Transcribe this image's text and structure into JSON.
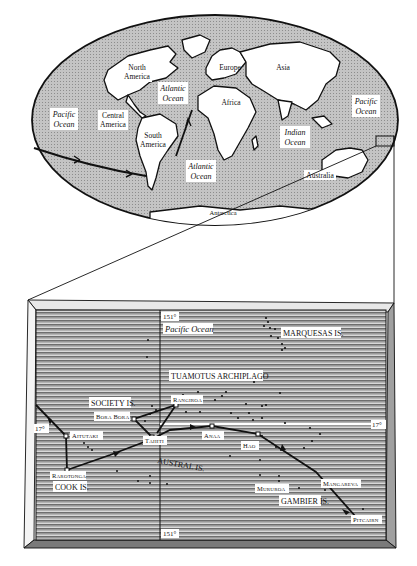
{
  "world_map": {
    "continents": [
      {
        "label_line1": "North",
        "label_line2": "America"
      },
      {
        "label_line1": "Central",
        "label_line2": "America"
      },
      {
        "label_line1": "South",
        "label_line2": "America"
      },
      {
        "label_line1": "Europe"
      },
      {
        "label_line1": "Asia"
      },
      {
        "label_line1": "Africa"
      },
      {
        "label_line1": "Australia"
      },
      {
        "label_line1": "Antarctica"
      }
    ],
    "oceans": [
      {
        "label_line1": "Pacific",
        "label_line2": "Ocean"
      },
      {
        "label_line1": "Atlantic",
        "label_line2": "Ocean"
      },
      {
        "label_line1": "Atlantic",
        "label_line2": "Ocean"
      },
      {
        "label_line1": "Indian",
        "label_line2": "Ocean"
      },
      {
        "label_line1": "Pacific",
        "label_line2": "Ocean"
      }
    ]
  },
  "inset_map": {
    "ocean_label": "Pacific Ocean",
    "longitude_top": "151°",
    "longitude_bottom": "151°",
    "latitude_left": "17°",
    "latitude_right": "17°",
    "groups": {
      "marquesas": "MARQUESAS IS.",
      "tuamotus": "TUAMOTUS ARCHIPLAGO",
      "society": "SOCIETY IS.",
      "austral": "AUSTRAL IS.",
      "cook": "COOK IS.",
      "gambier": "GAMBIER IS."
    },
    "places": {
      "aitutaki": "Aitutaki",
      "bora_bora": "Bora Bora",
      "rangiroa": "Rangiroa",
      "tahiti": "Tahiti",
      "anaa": "Anaa",
      "hao": "Hao",
      "rarotonga": "Rarotonga",
      "mururoa": "Mururoa",
      "mangareva": "Mangareva",
      "pitcairn": "Pitcairn"
    }
  },
  "colors": {
    "ocean": "#b9b9b9",
    "land": "#ffffff",
    "ink": "#111111",
    "inset_sea": "#9a9a9a"
  }
}
